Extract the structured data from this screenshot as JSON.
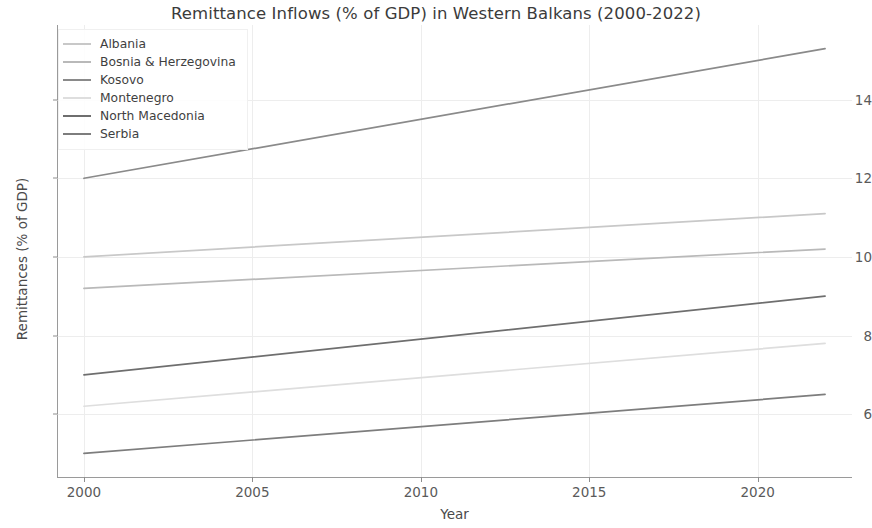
{
  "chart_data": {
    "type": "line",
    "title": "Remittance Inflows (% of GDP) in Western Balkans (2000-2022)",
    "xlabel": "Year",
    "ylabel": "Remittances (% of GDP)",
    "xlim": [
      1999.2,
      2022.8
    ],
    "ylim": [
      4.4,
      15.9
    ],
    "xticks": [
      "2000",
      "2005",
      "2010",
      "2015",
      "2020"
    ],
    "xtick_values": [
      2000,
      2005,
      2010,
      2015,
      2020
    ],
    "yticks": [
      "6",
      "8",
      "10",
      "12",
      "14"
    ],
    "ytick_values": [
      6,
      8,
      10,
      12,
      14
    ],
    "grid": true,
    "legend_position": "upper left",
    "x": [
      2000,
      2022
    ],
    "series": [
      {
        "name": "Albania",
        "color": "#c8c8c8",
        "values": [
          10.0,
          11.1
        ]
      },
      {
        "name": "Bosnia & Herzegovina",
        "color": "#b9b9b9",
        "values": [
          9.2,
          10.2
        ]
      },
      {
        "name": "Kosovo",
        "color": "#8a8a8a",
        "values": [
          12.0,
          15.3
        ]
      },
      {
        "name": "Montenegro",
        "color": "#dedede",
        "values": [
          6.2,
          7.8
        ]
      },
      {
        "name": "North Macedonia",
        "color": "#6e6e6e",
        "values": [
          7.0,
          9.0
        ]
      },
      {
        "name": "Serbia",
        "color": "#7d7d7d",
        "values": [
          5.0,
          6.5
        ]
      }
    ]
  },
  "legend": {
    "items": [
      {
        "label": "Albania"
      },
      {
        "label": "Bosnia & Herzegovina"
      },
      {
        "label": "Kosovo"
      },
      {
        "label": "Montenegro"
      },
      {
        "label": "North Macedonia"
      },
      {
        "label": "Serbia"
      }
    ]
  },
  "colors": {
    "background": "#ffffff",
    "axis": "#9a9a9a",
    "grid": "#ededed",
    "title_text": "#3b3b3b",
    "tick_text": "#5a5a5a"
  }
}
